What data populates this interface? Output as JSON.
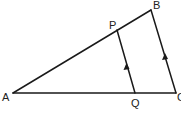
{
  "diagram": {
    "type": "geometry",
    "points": {
      "A": {
        "label": "A",
        "x": 13,
        "y": 93
      },
      "B": {
        "label": "B",
        "x": 151,
        "y": 10
      },
      "C": {
        "label": "C",
        "x": 176,
        "y": 93
      },
      "P": {
        "label": "P",
        "x": 117,
        "y": 30
      },
      "Q": {
        "label": "Q",
        "x": 135,
        "y": 93
      }
    },
    "segments": [
      "AB",
      "BC",
      "AC",
      "PQ"
    ],
    "parallel_marks": [
      "PQ",
      "BC"
    ],
    "colors": {
      "stroke": "#1a1a1a",
      "background": "#ffffff"
    }
  }
}
